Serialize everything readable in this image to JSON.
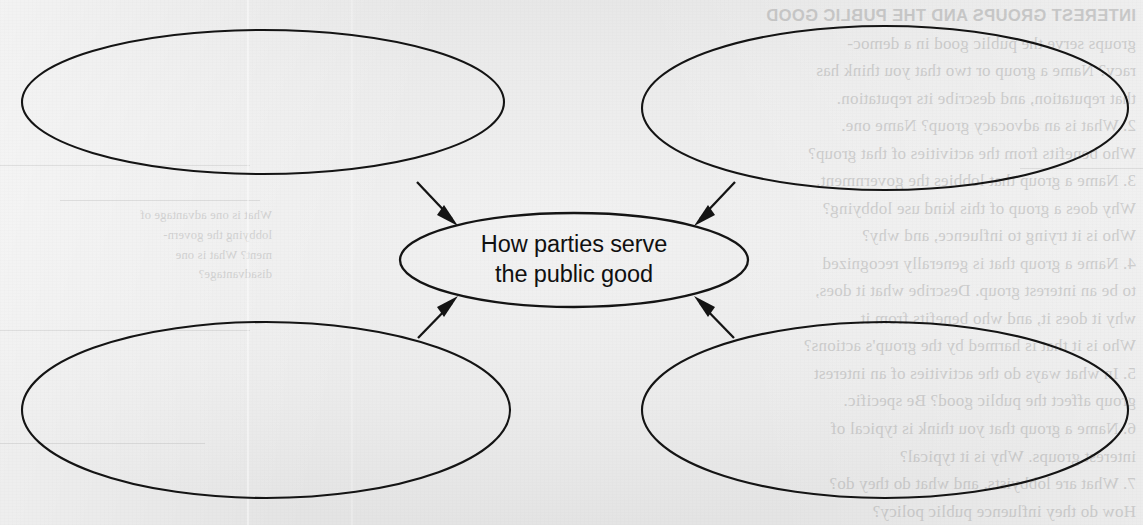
{
  "page": {
    "background_color": "#eeeeee",
    "ink_color": "#141414",
    "media": "scanned-textbook-page"
  },
  "diagram": {
    "type": "concept-web",
    "center": {
      "label_line_1": "How parties serve",
      "label_line_2": "the public good",
      "full_label": "How parties serve the public good",
      "shape": "ellipse"
    },
    "branches": [
      {
        "id": "top-left",
        "label": "",
        "shape": "ellipse",
        "arrow_direction": "to-center"
      },
      {
        "id": "top-right",
        "label": "",
        "shape": "ellipse",
        "arrow_direction": "to-center"
      },
      {
        "id": "bottom-left",
        "label": "",
        "shape": "ellipse",
        "arrow_direction": "to-center"
      },
      {
        "id": "bottom-right",
        "label": "",
        "shape": "ellipse",
        "arrow_direction": "to-center"
      }
    ]
  },
  "show_through": {
    "note": "faint mirrored text bleeding from the reverse side of the scanned page",
    "right_column_heading": "INTEREST GROUPS AND THE PUBLIC GOOD",
    "right_column_lines": [
      "groups serve the public good in a democ-",
      "racy? Name a group or two that you think has",
      "that reputation, and describe its reputation.",
      "2. What is an advocacy group? Name one.",
      "Who benefits from the activities of that group?",
      "3. Name a group that lobbies the government.",
      "Why does a group of this kind use lobbying?",
      "Who is it trying to influence, and why?",
      "4. Name a group that is generally recognized",
      "to be an interest group. Describe what it does,",
      "why it does it, and who benefits from it.",
      "Who is it that is harmed by the group's actions?",
      "5. In what ways do the activities of an interest",
      "group affect the public good? Be specific.",
      "6. Name a group that you think is typical of",
      "interest groups. Why is it typical?",
      "7. What are lobbyists, and what do they do?",
      "How do they influence public policy?"
    ],
    "left_column_lines": [
      "What is one advantage of",
      "lobbying the govern-",
      "ment? What is one",
      "disadvantage?"
    ]
  }
}
